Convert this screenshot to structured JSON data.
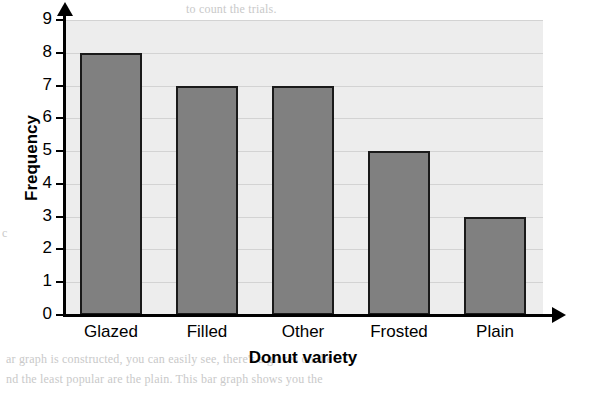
{
  "chart_data": {
    "type": "bar",
    "title": "",
    "categories": [
      "Glazed",
      "Filled",
      "Other",
      "Frosted",
      "Plain"
    ],
    "values": [
      8,
      7,
      7,
      5,
      3
    ],
    "xlabel": "Donut variety",
    "ylabel": "Frequency",
    "ylim": [
      0,
      9
    ],
    "yticks": [
      0,
      1,
      2,
      3,
      4,
      5,
      6,
      7,
      8,
      9
    ],
    "ytick_labels": [
      "0",
      "1",
      "2",
      "3",
      "4",
      "5",
      "6",
      "7",
      "8",
      "9"
    ],
    "grid": true,
    "legend": false,
    "colors": {
      "bar_fill": "#808080",
      "bar_outline": "#1a1a1a",
      "plot_background": "#ededed",
      "gridline": "#d3d3d3",
      "axis": "#000000"
    }
  },
  "background_text": {
    "top": "to count the trials.",
    "left": "c",
    "bottom_1": "ar graph is constructed, you can easily see, there's a glazes on the",
    "bottom_2": "nd the least popular are the plain. This bar graph shows you the"
  }
}
